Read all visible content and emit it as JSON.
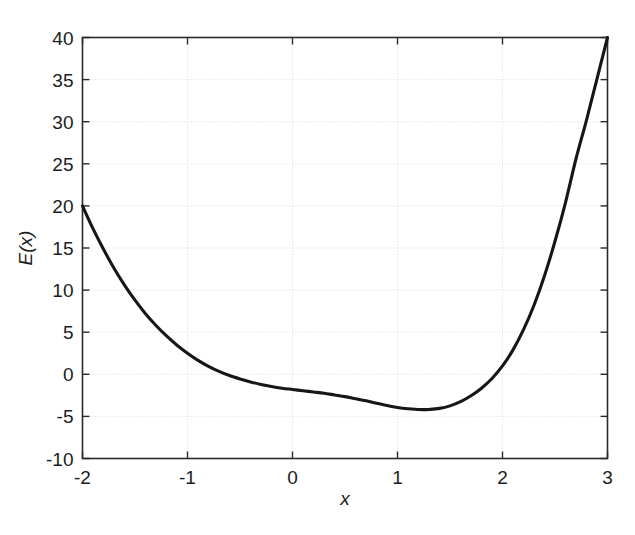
{
  "figure": {
    "background_color": "#ffffff",
    "axes_color": "#2a2a2a",
    "grid_color": "#d9d9d9",
    "curve_color": "#161616"
  },
  "axis": {
    "x_title": "x",
    "y_title": "E(x)",
    "x_tick_labels": [
      "-2",
      "-1",
      "0",
      "1",
      "2",
      "3"
    ],
    "y_tick_labels": [
      "40",
      "35",
      "30",
      "25",
      "20",
      "15",
      "10",
      "5",
      "0",
      "-5",
      "-10"
    ]
  },
  "chart_data": {
    "type": "line",
    "title": "",
    "subtitle": "",
    "xlabel": "x",
    "ylabel": "E(x)",
    "xlim": [
      -2,
      3
    ],
    "ylim": [
      -10,
      40
    ],
    "xticks": [
      -2,
      -1,
      0,
      1,
      2,
      3
    ],
    "yticks": [
      -10,
      -5,
      0,
      5,
      10,
      15,
      20,
      25,
      30,
      35,
      40
    ],
    "grid": true,
    "grid_style": "dotted",
    "legend": null,
    "legend_position": "none",
    "annotations": [],
    "series": [
      {
        "name": "E(x)",
        "color": "#161616",
        "linewidth": 3.1,
        "x": [
          -2.0,
          -1.9,
          -1.8,
          -1.7,
          -1.6,
          -1.5,
          -1.4,
          -1.3,
          -1.2,
          -1.1,
          -1.0,
          -0.9,
          -0.8,
          -0.7,
          -0.6,
          -0.5,
          -0.4,
          -0.3,
          -0.2,
          -0.1,
          0.0,
          0.1,
          0.2,
          0.3,
          0.4,
          0.5,
          0.6,
          0.7,
          0.8,
          0.9,
          1.0,
          1.1,
          1.2,
          1.25,
          1.3,
          1.4,
          1.5,
          1.6,
          1.7,
          1.8,
          1.9,
          2.0,
          2.1,
          2.2,
          2.3,
          2.4,
          2.5,
          2.6,
          2.7,
          2.8,
          2.9,
          3.0
        ],
        "y": [
          20.0,
          17.3,
          14.85,
          12.6,
          10.6,
          8.8,
          7.2,
          5.8,
          4.55,
          3.45,
          2.5,
          1.65,
          0.95,
          0.35,
          -0.15,
          -0.55,
          -0.9,
          -1.2,
          -1.45,
          -1.65,
          -1.8,
          -1.95,
          -2.1,
          -2.25,
          -2.45,
          -2.65,
          -2.9,
          -3.15,
          -3.45,
          -3.7,
          -3.95,
          -4.1,
          -4.18,
          -4.2,
          -4.18,
          -4.05,
          -3.75,
          -3.25,
          -2.55,
          -1.65,
          -0.5,
          1.0,
          2.9,
          5.3,
          8.2,
          11.7,
          15.8,
          20.4,
          25.6,
          30.2,
          35.1,
          40.0
        ],
        "notable_points": {
          "left_endpoint": {
            "x": -2,
            "y": 20
          },
          "zero_crossing_left": {
            "x": -0.65,
            "y": 0
          },
          "shoulder": {
            "x": 0.0,
            "y": -1.8
          },
          "minimum": {
            "x": 1.25,
            "y": -4.2
          },
          "zero_crossing_right": {
            "x": 1.93,
            "y": 0
          },
          "right_endpoint": {
            "x": 3,
            "y": 40
          }
        }
      }
    ]
  }
}
